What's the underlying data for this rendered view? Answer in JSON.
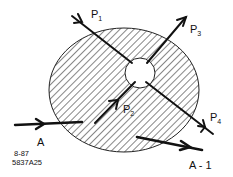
{
  "diagram": {
    "colors": {
      "ink": "#111111",
      "background": "#ffffff",
      "hatch": "#222222"
    },
    "region": {
      "name": "interaction-region",
      "fill": "hatched"
    },
    "core": {
      "name": "interaction-point",
      "fill": "blank"
    },
    "labels": {
      "p1": {
        "base": "P",
        "sub": "1"
      },
      "p2": {
        "base": "P",
        "sub": "2"
      },
      "p3": {
        "base": "P",
        "sub": "3"
      },
      "p4": {
        "base": "P",
        "sub": "4"
      },
      "a": "A",
      "a1": "A - 1"
    },
    "footer": {
      "date": "8-87",
      "code": "5837A25"
    },
    "arrows": [
      {
        "id": "P1",
        "direction": "incoming"
      },
      {
        "id": "P2",
        "direction": "incoming"
      },
      {
        "id": "P3",
        "direction": "outgoing"
      },
      {
        "id": "P4",
        "direction": "outgoing"
      },
      {
        "id": "A",
        "direction": "incoming"
      },
      {
        "id": "A-1",
        "direction": "outgoing"
      }
    ]
  }
}
